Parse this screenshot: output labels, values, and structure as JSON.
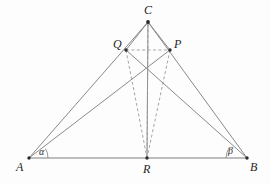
{
  "figure": {
    "kind": "geometry-diagram",
    "width": 271,
    "height": 185,
    "background_color": "#fdfdfd",
    "line_color": "#8a8a8a",
    "dashed_color": "#9a9a9a",
    "label_color": "#1f1f1f"
  },
  "points": {
    "A": {
      "label": "A",
      "x": 29,
      "y": 158,
      "label_x": 16,
      "label_y": 161
    },
    "B": {
      "label": "B",
      "x": 247,
      "y": 158,
      "label_x": 250,
      "label_y": 161
    },
    "C": {
      "label": "C",
      "x": 148,
      "y": 22,
      "label_x": 144,
      "label_y": 4
    },
    "Q": {
      "label": "Q",
      "x": 126,
      "y": 50,
      "label_x": 113,
      "label_y": 38
    },
    "P": {
      "label": "P",
      "x": 170,
      "y": 50,
      "label_x": 174,
      "label_y": 38
    },
    "R": {
      "label": "R",
      "x": 147,
      "y": 158,
      "label_x": 143,
      "label_y": 163
    }
  },
  "angles": {
    "alpha": {
      "label": "α",
      "at_point": "A",
      "label_x": 39,
      "label_y": 147
    },
    "beta": {
      "label": "β",
      "at_point": "B",
      "label_x": 228,
      "label_y": 146
    }
  },
  "segments_solid": [
    {
      "name": "A-B",
      "from": "A",
      "to": "B"
    },
    {
      "name": "A-C",
      "from": "A",
      "to": "C"
    },
    {
      "name": "A-P",
      "from": "A",
      "to": "P"
    },
    {
      "name": "B-C",
      "from": "B",
      "to": "C"
    },
    {
      "name": "B-Q",
      "from": "B",
      "to": "Q"
    },
    {
      "name": "C-Q",
      "from": "C",
      "to": "Q"
    },
    {
      "name": "C-P",
      "from": "C",
      "to": "P"
    },
    {
      "name": "C-R",
      "from": "C",
      "to": "R"
    }
  ],
  "segments_dashed": [
    {
      "name": "Q-P",
      "from": "Q",
      "to": "P"
    },
    {
      "name": "Q-R",
      "from": "Q",
      "to": "R"
    },
    {
      "name": "P-R",
      "from": "P",
      "to": "R"
    },
    {
      "name": "C-R-overlay",
      "from": "C",
      "to": "R"
    }
  ]
}
